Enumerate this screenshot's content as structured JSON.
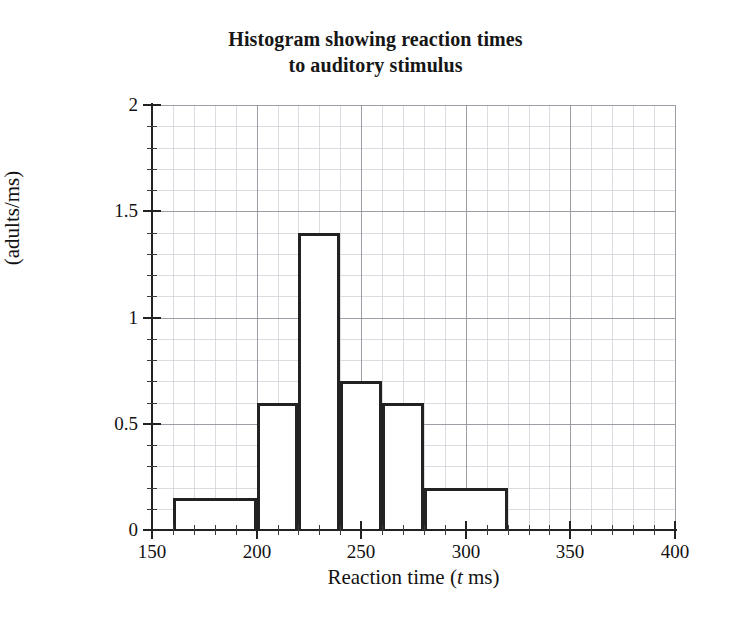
{
  "chart_data": {
    "type": "bar",
    "title": "Histogram showing reaction times to auditory stimulus",
    "title_line1": "Histogram showing reaction times",
    "title_line2": "to auditory stimulus",
    "xlabel": "Reaction time (t ms)",
    "xlabel_prefix": "Reaction time (",
    "xlabel_italic": "t",
    "xlabel_suffix": " ms)",
    "ylabel": "Frequency density (adults/ms)",
    "ylabel_line1": "Frequency density",
    "ylabel_line2": "(adults/ms)",
    "xlim": [
      150,
      400
    ],
    "ylim": [
      0,
      2
    ],
    "x_major_ticks": [
      150,
      200,
      250,
      300,
      350,
      400
    ],
    "x_minor_step": 10,
    "y_major_ticks": [
      0,
      0.5,
      1,
      1.5,
      2
    ],
    "y_minor_step": 0.1,
    "x_tick_labels": [
      "150",
      "200",
      "250",
      "300",
      "350",
      "400"
    ],
    "y_tick_labels": [
      "0",
      "0.5",
      "1",
      "1.5",
      "2"
    ],
    "grid": true,
    "grid_major_color": "#8c8c96",
    "grid_minor_color": "#cfcfd8",
    "bar_edge_color": "#222222",
    "bar_fill_color": "#ffffff",
    "bins": [
      {
        "start": 160,
        "end": 200,
        "value": 0.15,
        "label": "160-200"
      },
      {
        "start": 200,
        "end": 220,
        "value": 0.6,
        "label": "200-220"
      },
      {
        "start": 220,
        "end": 240,
        "value": 1.4,
        "label": "220-240"
      },
      {
        "start": 240,
        "end": 260,
        "value": 0.7,
        "label": "240-260"
      },
      {
        "start": 260,
        "end": 280,
        "value": 0.6,
        "label": "260-280"
      },
      {
        "start": 280,
        "end": 320,
        "value": 0.2,
        "label": "280-320"
      }
    ],
    "categories": [
      "160-200",
      "200-220",
      "220-240",
      "240-260",
      "260-280",
      "280-320"
    ],
    "values": [
      0.15,
      0.6,
      1.4,
      0.7,
      0.6,
      0.2
    ]
  }
}
